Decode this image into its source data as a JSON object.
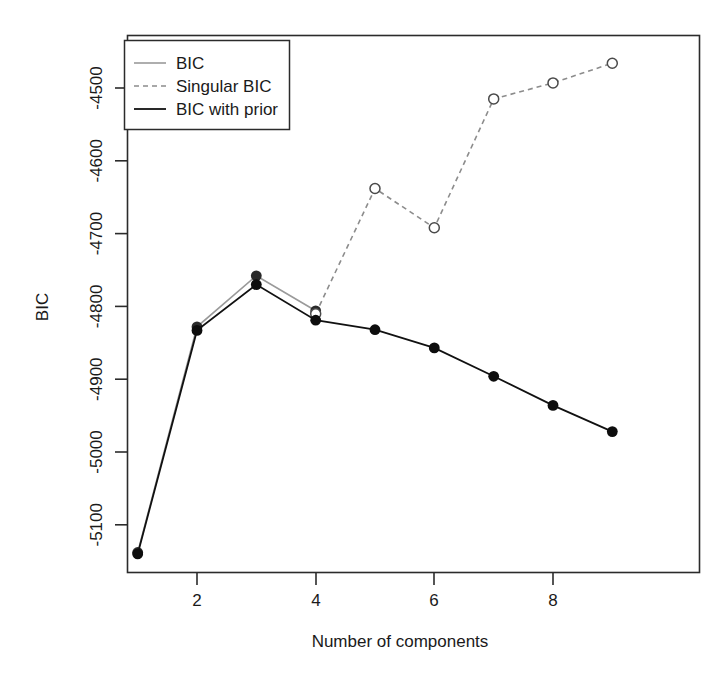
{
  "chart_data": {
    "type": "line",
    "title": "",
    "xlabel": "Number of components",
    "ylabel": "BIC",
    "x": [
      1,
      2,
      3,
      4,
      5,
      6,
      7,
      8,
      9
    ],
    "xlim": [
      0.7,
      9.4
    ],
    "ylim": [
      -5175,
      -4440
    ],
    "xticks": [
      2,
      4,
      6,
      8
    ],
    "xtick_labels": [
      "2",
      "4",
      "6",
      "8"
    ],
    "yticks": [
      -4500,
      -4600,
      -4700,
      -4800,
      -4900,
      -5000,
      -5100
    ],
    "ytick_labels": [
      "-4500",
      "-4600",
      "-4700",
      "-4800",
      "-4900",
      "-5000",
      "-5100"
    ],
    "grid": false,
    "legend_position": "top-left",
    "series": [
      {
        "name": "BIC",
        "key": "bic",
        "color": "#9a9a9a",
        "line_style": "solid",
        "marker": "filled-circle",
        "x": [
          1,
          2,
          3,
          4
        ],
        "values": [
          -5138,
          -4828,
          -4758,
          -4806
        ]
      },
      {
        "name": "Singular BIC",
        "key": "singular_bic",
        "color": "#8c8c8c",
        "line_style": "dashed",
        "marker": "open-circle",
        "x": [
          4,
          5,
          6,
          7,
          8,
          9
        ],
        "values": [
          -4810,
          -4638,
          -4692,
          -4515,
          -4493,
          -4466
        ]
      },
      {
        "name": "BIC with prior",
        "key": "bic_with_prior",
        "color": "#111111",
        "line_style": "solid",
        "marker": "filled-circle",
        "x": [
          1,
          2,
          3,
          4,
          5,
          6,
          7,
          8,
          9
        ],
        "values": [
          -5140,
          -4833,
          -4770,
          -4819,
          -4832,
          -4857,
          -4896,
          -4936,
          -4972
        ]
      }
    ]
  },
  "legend": {
    "items": [
      {
        "label": "BIC"
      },
      {
        "label": "Singular BIC"
      },
      {
        "label": "BIC with prior"
      }
    ]
  },
  "axes": {
    "x_title": "Number of components",
    "y_title": "BIC"
  }
}
